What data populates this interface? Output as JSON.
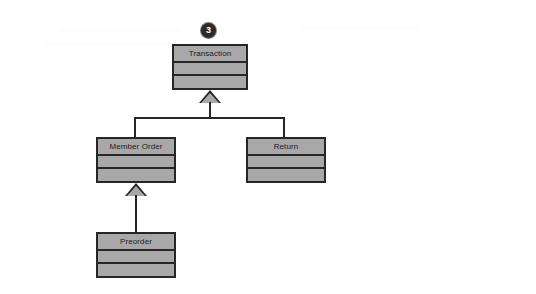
{
  "diagram": {
    "type": "uml-class-diagram",
    "title": "",
    "background_color": "#ffffff",
    "class_fill_color": "#a8a8a8",
    "class_border_color": "#262626",
    "badge": {
      "label": "3",
      "shape": "filled-circle",
      "background_color": "#2b2b2b",
      "text_color": "#ffffff"
    },
    "classes": [
      {
        "id": "transaction",
        "name": "Transaction",
        "attributes": [],
        "operations": []
      },
      {
        "id": "member-order",
        "name": "Member Order",
        "attributes": [],
        "operations": []
      },
      {
        "id": "return",
        "name": "Return",
        "attributes": [],
        "operations": []
      },
      {
        "id": "preorder",
        "name": "Preorder",
        "attributes": [],
        "operations": []
      }
    ],
    "relationships": [
      {
        "type": "generalization",
        "child": "Member Order",
        "parent": "Transaction"
      },
      {
        "type": "generalization",
        "child": "Return",
        "parent": "Transaction"
      },
      {
        "type": "generalization",
        "child": "Preorder",
        "parent": "Member Order"
      }
    ]
  }
}
